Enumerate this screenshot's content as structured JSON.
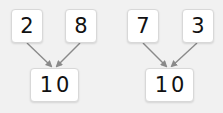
{
  "diagram": {
    "type": "number-bond",
    "background_color": "#f1f1f1",
    "arrow_color": "#8a8a8a",
    "groups": [
      {
        "parts": [
          {
            "label": "2"
          },
          {
            "label": "8"
          }
        ],
        "whole": {
          "label": "10"
        }
      },
      {
        "parts": [
          {
            "label": "7"
          },
          {
            "label": "3"
          }
        ],
        "whole": {
          "label": "10"
        }
      }
    ]
  }
}
